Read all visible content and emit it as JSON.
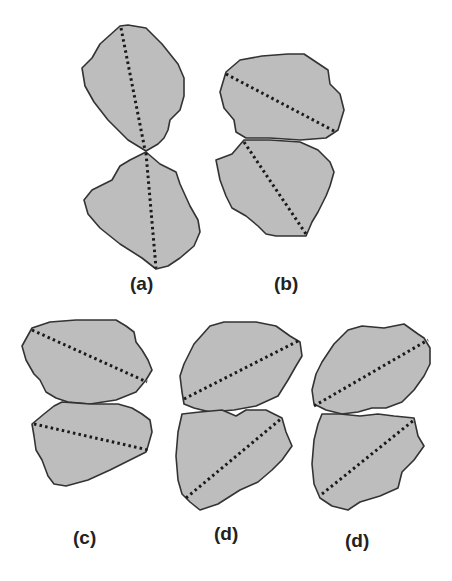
{
  "figure": {
    "colors": {
      "grain_fill": "#bdbdbd",
      "grain_outline": "#333333",
      "axis_line": "#1a1a1a",
      "background": "#ffffff"
    },
    "panels": [
      {
        "id": "a",
        "label": "(a)",
        "arrangement": "two grains touching at a single point, long axes nearly vertical and aligned"
      },
      {
        "id": "b",
        "label": "(b)",
        "arrangement": "two grains stacked with flat contact, upper axis descending right, lower axis descending right"
      },
      {
        "id": "c",
        "label": "(c)",
        "arrangement": "two grains stacked with narrow neck contact, both axes descending right"
      },
      {
        "id": "d1",
        "label": "(d)",
        "arrangement": "two grains stacked with small gap at contact, both axes ascending right"
      },
      {
        "id": "d2",
        "label": "(d)",
        "arrangement": "two grains stacked with flat contact, both axes ascending right"
      }
    ]
  }
}
